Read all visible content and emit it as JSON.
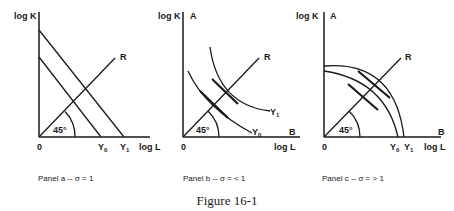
{
  "figure": {
    "title": "Figure 16-1"
  },
  "panels": [
    {
      "id": "a",
      "y_axis_label": "log K",
      "x_axis_label": "log L",
      "origin_label": "0",
      "ray_label": "R",
      "angle_label": "45°",
      "isoquant_labels": [
        "Y0",
        "Y1"
      ],
      "caption": "Panel a -- σ = 1",
      "isoquant_shape": "straight lines"
    },
    {
      "id": "b",
      "y_axis_label": "log K",
      "y_axis_end_label": "A",
      "x_axis_label": "log L",
      "x_axis_end_label": "B",
      "origin_label": "0",
      "ray_label": "R",
      "angle_label": "45°",
      "isoquant_labels": [
        "Y0",
        "Y1"
      ],
      "caption": "Panel b -- σ = < 1",
      "isoquant_shape": "convex curves"
    },
    {
      "id": "c",
      "y_axis_label": "log K",
      "y_axis_end_label": "A",
      "x_axis_label": "log L",
      "x_axis_end_label": "B",
      "origin_label": "0",
      "ray_label": "R",
      "angle_label": "45°",
      "isoquant_labels": [
        "Y0",
        "Y1"
      ],
      "caption": "Panel c -- σ = > 1",
      "isoquant_shape": "concave curves"
    }
  ]
}
